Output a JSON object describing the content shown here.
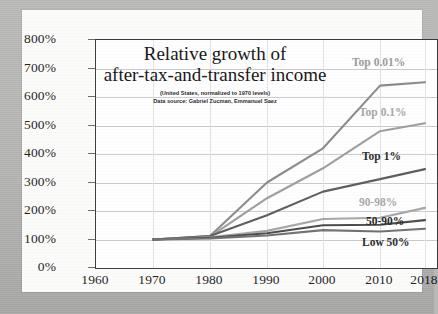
{
  "chart_data": {
    "type": "line",
    "title": "Relative growth of after-tax-and-transfer income",
    "title_line1": "Relative growth of",
    "title_line2": "after-tax-and-transfer income",
    "subtitle_line1": "(United States, normalized to 1970 levels)",
    "subtitle_line2": "Data source: Gabriel Zucman, Emmanuel Saez",
    "xlabel": "",
    "ylabel": "",
    "x": [
      1960,
      1970,
      1980,
      1990,
      2000,
      2010,
      2018
    ],
    "xticklabels": [
      "1960",
      "1970",
      "1980",
      "1990",
      "2000",
      "2010",
      "2018"
    ],
    "yticklabels": [
      "0%",
      "100%",
      "200%",
      "300%",
      "400%",
      "500%",
      "600%",
      "700%",
      "800%"
    ],
    "ytickvalues": [
      0,
      100,
      200,
      300,
      400,
      500,
      600,
      700,
      800
    ],
    "ylim": [
      0,
      800
    ],
    "xlim": [
      1960,
      2018
    ],
    "grid": true,
    "legend": "inline-right-of-series",
    "series": [
      {
        "name": "Top 0.01%",
        "color": "#8a8a8a",
        "label_color": "#9a9a9a",
        "values": [
          null,
          100,
          112,
          300,
          420,
          640,
          652
        ]
      },
      {
        "name": "Top 0.1%",
        "color": "#9d9d9d",
        "label_color": "#a6a6a6",
        "values": [
          null,
          100,
          110,
          245,
          350,
          480,
          508
        ]
      },
      {
        "name": "Top 1%",
        "color": "#5c5c5c",
        "label_color": "#2b2b2b",
        "values": [
          null,
          100,
          112,
          185,
          268,
          312,
          347
        ]
      },
      {
        "name": "90-98%",
        "color": "#a5a5a5",
        "label_color": "#a8a8a8",
        "values": [
          null,
          100,
          108,
          130,
          172,
          176,
          211
        ]
      },
      {
        "name": "50-90%",
        "color": "#4a4a4a",
        "label_color": "#242424",
        "values": [
          null,
          100,
          106,
          122,
          150,
          152,
          168
        ]
      },
      {
        "name": "Low 50%",
        "color": "#707070",
        "label_color": "#2b2b2b",
        "values": [
          null,
          100,
          104,
          114,
          133,
          128,
          138
        ]
      }
    ],
    "series_label_positions": [
      {
        "name": "Top 0.01%",
        "x": 330,
        "y": 46
      },
      {
        "name": "Top 0.1%",
        "x": 337,
        "y": 96
      },
      {
        "name": "Top 1%",
        "x": 340,
        "y": 140
      },
      {
        "name": "90-98%",
        "x": 337,
        "y": 186
      },
      {
        "name": "50-90%",
        "x": 344,
        "y": 205
      },
      {
        "name": "Low 50%",
        "x": 340,
        "y": 226
      }
    ]
  }
}
